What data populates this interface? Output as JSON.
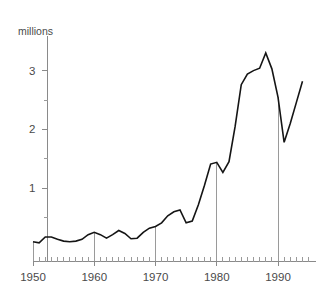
{
  "chart_data": {
    "type": "line",
    "title": "",
    "subtitle": "",
    "unit_label": "millions",
    "xlabel": "",
    "ylabel": "millions",
    "xlim": [
      1950,
      1994
    ],
    "ylim": [
      0,
      3.45
    ],
    "grid": false,
    "legend": null,
    "y_major_ticks": [
      1,
      2,
      3
    ],
    "y_major_tick_labels": [
      "1",
      "2",
      "3"
    ],
    "y_minor_ticks": [
      0.5,
      1.5,
      2.5
    ],
    "x_major_ticks": [
      1950,
      1960,
      1970,
      1980,
      1990
    ],
    "x_major_tick_labels": [
      "1950",
      "1960",
      "1970",
      "1980",
      "1990"
    ],
    "x_minor_tick_interval": 1,
    "vertical_reference_years": [
      1950,
      1960,
      1970,
      1980,
      1990
    ],
    "series_name": "",
    "x": [
      1950,
      1951,
      1952,
      1953,
      1954,
      1955,
      1956,
      1957,
      1958,
      1959,
      1960,
      1961,
      1962,
      1963,
      1964,
      1965,
      1966,
      1967,
      1968,
      1969,
      1970,
      1971,
      1972,
      1973,
      1974,
      1975,
      1976,
      1977,
      1978,
      1979,
      1980,
      1981,
      1982,
      1983,
      1984,
      1985,
      1986,
      1987,
      1988,
      1989,
      1990,
      1991,
      1992,
      1993,
      1994
    ],
    "values": [
      0.09,
      0.07,
      0.17,
      0.17,
      0.13,
      0.1,
      0.09,
      0.1,
      0.13,
      0.21,
      0.25,
      0.21,
      0.15,
      0.21,
      0.28,
      0.23,
      0.14,
      0.15,
      0.25,
      0.32,
      0.35,
      0.41,
      0.53,
      0.6,
      0.63,
      0.41,
      0.44,
      0.72,
      1.05,
      1.41,
      1.44,
      1.27,
      1.45,
      2.05,
      2.76,
      2.94,
      3.0,
      3.04,
      3.3,
      3.03,
      2.55,
      1.78,
      2.1,
      2.46,
      2.82
    ]
  },
  "axis": {
    "y_unit_caption": "millions"
  }
}
